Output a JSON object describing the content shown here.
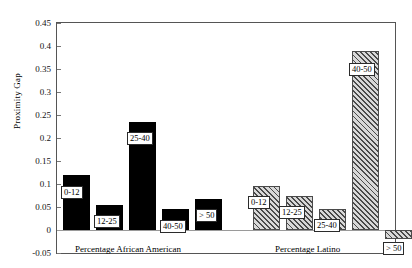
{
  "chart_data": {
    "type": "bar",
    "title": "",
    "xlabel": "",
    "ylabel": "Proximity Gap",
    "ylim": [
      -0.05,
      0.45
    ],
    "ytick_labels": [
      "0.45",
      "0.4",
      "0.35",
      "0.3",
      "0.25",
      "0.2",
      "0.15",
      "0.1",
      "0.05",
      "0",
      "-0.05"
    ],
    "ytick_values": [
      0.45,
      0.4,
      0.35,
      0.3,
      0.25,
      0.2,
      0.15,
      0.1,
      0.05,
      0,
      -0.05
    ],
    "grid": false,
    "legend": "none",
    "categories": [
      "0-12",
      "12-25",
      "25-40",
      "40-50",
      "> 50"
    ],
    "series": [
      {
        "name": "Percentage African American",
        "fill": "solid-black",
        "values": [
          0.12,
          0.055,
          0.235,
          0.045,
          0.068
        ]
      },
      {
        "name": "Percentage Latino",
        "fill": "diagonal-hatch",
        "values": [
          0.095,
          0.075,
          0.045,
          0.39,
          -0.02
        ]
      }
    ],
    "group_captions": [
      "Percentage African American",
      "Percentage Latino"
    ],
    "annotations": {
      "aa_bar_labels": [
        "0-12",
        "12-25",
        "25-40",
        "40-50",
        "> 50"
      ],
      "latino_bar_labels": [
        "0-12",
        "12-25",
        "25-40",
        "40-50",
        "> 50"
      ]
    }
  },
  "axis": {
    "y_title": "Proximity Gap",
    "ticks": [
      "0.45",
      "0.4",
      "0.35",
      "0.3",
      "0.25",
      "0.2",
      "0.15",
      "0.1",
      "0.05",
      "0",
      "-0.05"
    ]
  },
  "groups": {
    "african_american": {
      "caption": "Percentage African American",
      "bars": [
        {
          "label": "0-12",
          "value": 0.12
        },
        {
          "label": "12-25",
          "value": 0.055
        },
        {
          "label": "25-40",
          "value": 0.235
        },
        {
          "label": "40-50",
          "value": 0.045
        },
        {
          "label": "> 50",
          "value": 0.068
        }
      ]
    },
    "latino": {
      "caption": "Percentage Latino",
      "bars": [
        {
          "label": "0-12",
          "value": 0.095
        },
        {
          "label": "12-25",
          "value": 0.075
        },
        {
          "label": "25-40",
          "value": 0.045
        },
        {
          "label": "40-50",
          "value": 0.39
        },
        {
          "label": "> 50",
          "value": -0.02
        }
      ]
    }
  },
  "caption": {
    "text": ""
  }
}
